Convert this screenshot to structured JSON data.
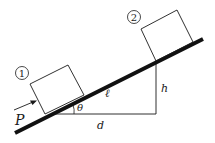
{
  "diagram": {
    "type": "inclined-plane",
    "labels": {
      "block1": "1",
      "block2": "2",
      "force": "P",
      "angle": "θ",
      "length": "ℓ",
      "height": "h",
      "base": "d"
    },
    "colors": {
      "stroke": "#1a1a1a",
      "background": "#ffffff"
    }
  }
}
